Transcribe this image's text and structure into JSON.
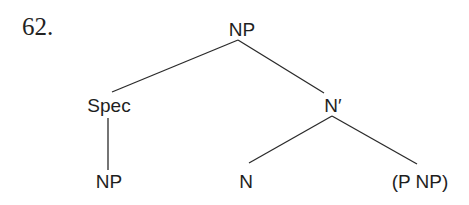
{
  "example": {
    "number": "62."
  },
  "tree": {
    "root": {
      "label": "NP"
    },
    "spec": {
      "label": "Spec"
    },
    "spec_child": {
      "label": "NP"
    },
    "n_bar": {
      "label": "N′"
    },
    "n_head": {
      "label": "N"
    },
    "complement": {
      "label": "(P NP)"
    }
  },
  "colors": {
    "background": "#ffffff",
    "text": "#1e1e1e",
    "edge": "#2a2a2a"
  }
}
